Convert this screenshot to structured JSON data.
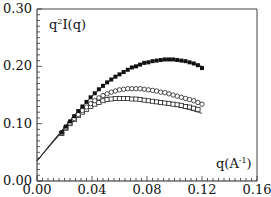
{
  "chart_data": {
    "type": "scatter",
    "title": "",
    "xlabel": "q(A^-1)",
    "ylabel": "q^2 I(q)",
    "xlim": [
      0.0,
      0.16
    ],
    "ylim": [
      0.0,
      0.3
    ],
    "grid": false,
    "legend": null,
    "x_ticks": [
      "0.00",
      "0.04",
      "0.08",
      "0.12",
      "0.16"
    ],
    "y_ticks": [
      "0.00",
      "0.10",
      "0.20",
      "0.30"
    ],
    "annotations": {
      "ylabel_text": "q",
      "ylabel_sup": "2",
      "ylabel_rest": "I(q)",
      "xlabel_text": "q(A",
      "xlabel_sup": "-1",
      "xlabel_rest": ")"
    },
    "series": [
      {
        "name": "filled squares",
        "marker": "filled-square",
        "x": [
          0.018,
          0.021,
          0.024,
          0.027,
          0.03,
          0.033,
          0.036,
          0.039,
          0.042,
          0.045,
          0.048,
          0.051,
          0.054,
          0.057,
          0.06,
          0.063,
          0.066,
          0.069,
          0.072,
          0.075,
          0.078,
          0.081,
          0.084,
          0.087,
          0.09,
          0.093,
          0.096,
          0.099,
          0.102,
          0.105,
          0.108,
          0.111,
          0.114,
          0.117,
          0.12
        ],
        "values": [
          0.085,
          0.095,
          0.104,
          0.113,
          0.122,
          0.13,
          0.138,
          0.146,
          0.153,
          0.16,
          0.166,
          0.172,
          0.177,
          0.182,
          0.186,
          0.19,
          0.194,
          0.198,
          0.2,
          0.203,
          0.206,
          0.207,
          0.209,
          0.21,
          0.211,
          0.212,
          0.212,
          0.212,
          0.211,
          0.21,
          0.209,
          0.207,
          0.205,
          0.202,
          0.197
        ]
      },
      {
        "name": "open circles",
        "marker": "open-circle",
        "x": [
          0.018,
          0.021,
          0.024,
          0.027,
          0.03,
          0.033,
          0.036,
          0.039,
          0.042,
          0.045,
          0.048,
          0.051,
          0.054,
          0.057,
          0.06,
          0.063,
          0.066,
          0.069,
          0.072,
          0.075,
          0.078,
          0.081,
          0.084,
          0.087,
          0.09,
          0.093,
          0.096,
          0.099,
          0.102,
          0.105,
          0.108,
          0.111,
          0.114,
          0.117,
          0.12
        ],
        "values": [
          0.084,
          0.093,
          0.101,
          0.109,
          0.116,
          0.123,
          0.129,
          0.135,
          0.14,
          0.145,
          0.149,
          0.152,
          0.155,
          0.157,
          0.159,
          0.16,
          0.161,
          0.161,
          0.161,
          0.161,
          0.16,
          0.159,
          0.158,
          0.157,
          0.155,
          0.154,
          0.152,
          0.15,
          0.148,
          0.146,
          0.144,
          0.142,
          0.14,
          0.137,
          0.134
        ]
      },
      {
        "name": "open squares",
        "marker": "open-square",
        "x": [
          0.018,
          0.021,
          0.024,
          0.027,
          0.03,
          0.033,
          0.036,
          0.039,
          0.042,
          0.045,
          0.048,
          0.051,
          0.054,
          0.057,
          0.06,
          0.063,
          0.066,
          0.069,
          0.072,
          0.075,
          0.078,
          0.081,
          0.084,
          0.087,
          0.09,
          0.093,
          0.096,
          0.099,
          0.102,
          0.105,
          0.108,
          0.111,
          0.114,
          0.117
        ],
        "values": [
          0.083,
          0.092,
          0.1,
          0.107,
          0.114,
          0.12,
          0.125,
          0.13,
          0.134,
          0.137,
          0.14,
          0.142,
          0.143,
          0.144,
          0.144,
          0.144,
          0.144,
          0.143,
          0.143,
          0.142,
          0.141,
          0.14,
          0.139,
          0.138,
          0.137,
          0.136,
          0.135,
          0.134,
          0.133,
          0.132,
          0.13,
          0.129,
          0.127,
          0.125
        ]
      }
    ],
    "fit_lines": [
      {
        "name": "fit upper",
        "x": [
          0.0,
          0.01,
          0.02,
          0.03,
          0.04,
          0.05,
          0.06,
          0.07,
          0.08,
          0.09,
          0.1,
          0.11,
          0.12
        ],
        "values": [
          0.035,
          0.065,
          0.094,
          0.122,
          0.148,
          0.169,
          0.186,
          0.199,
          0.207,
          0.211,
          0.211,
          0.207,
          0.2
        ]
      },
      {
        "name": "fit middle",
        "x": [
          0.0,
          0.01,
          0.02,
          0.03,
          0.04,
          0.05,
          0.06,
          0.07,
          0.08,
          0.09,
          0.1,
          0.11,
          0.12
        ],
        "values": [
          0.035,
          0.064,
          0.092,
          0.116,
          0.138,
          0.151,
          0.158,
          0.161,
          0.16,
          0.156,
          0.15,
          0.143,
          0.136
        ]
      },
      {
        "name": "fit lower",
        "x": [
          0.0,
          0.01,
          0.02,
          0.03,
          0.04,
          0.05,
          0.06,
          0.07,
          0.08,
          0.09,
          0.1,
          0.11,
          0.12
        ],
        "values": [
          0.035,
          0.063,
          0.09,
          0.113,
          0.132,
          0.141,
          0.144,
          0.143,
          0.14,
          0.136,
          0.131,
          0.125,
          0.118
        ]
      }
    ]
  }
}
